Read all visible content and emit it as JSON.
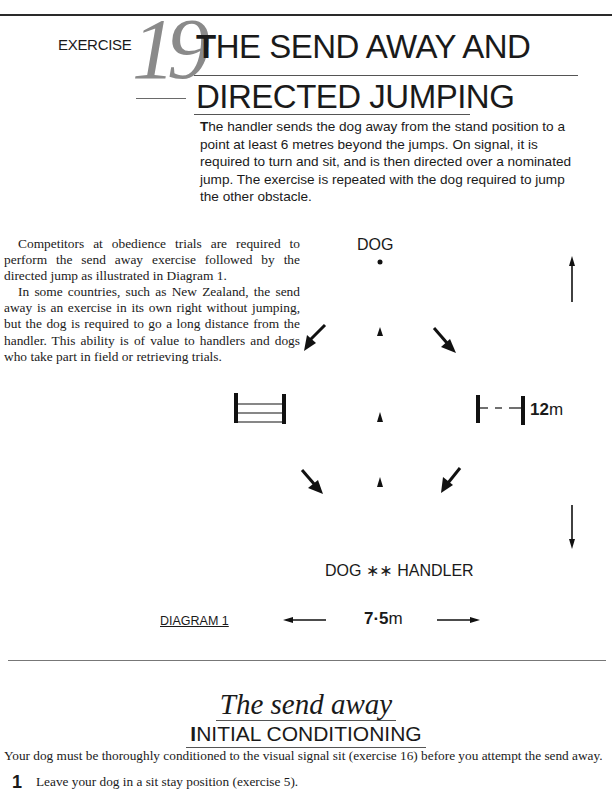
{
  "header": {
    "exercise_label": "EXERCISE",
    "exercise_number": "19",
    "title_line1_initial": "T",
    "title_line1_rest": "HE SEND AWAY AND",
    "title_line2": "DIRECTED JUMPING"
  },
  "intro": {
    "dropcap": "T",
    "text": "he handler sends the dog away from the stand position to a point at least 6 metres beyond the jumps. On signal, it is required to turn and sit, and is then directed over a nominated jump. The exercise is repeated with the dog required to jump the other obstacle."
  },
  "body": {
    "paragraphs": [
      "Competitors at obedience trials are required to perform the send away exercise followed by the directed jump as illustrated in Diagram 1.",
      "In some countries, such as New Zealand, the send away is an exercise in its own right without jumping, but the dog is required to go a long distance from the handler. This ability is of value to handlers and dogs who take part in field or retrieving trials."
    ]
  },
  "diagram": {
    "dog_label": "DOG",
    "bottom_label": "DOG ∗∗ HANDLER",
    "height_dimension_value": "12",
    "height_dimension_unit": "m",
    "width_dimension_value": "7·5",
    "width_dimension_unit": "m",
    "caption": "DIAGRAM 1",
    "left_jump": "bar-jump",
    "right_jump": "broad-jump"
  },
  "section": {
    "title": "The send away",
    "subtitle_initial": "I",
    "subtitle_rest": "NITIAL CONDITIONING",
    "lead": "Your dog must be thoroughly conditioned to the visual signal sit (exercise 16) before you attempt the send away.",
    "steps": [
      {
        "number": "1",
        "text": "Leave your dog in a sit stay position (exercise 5)."
      }
    ]
  }
}
